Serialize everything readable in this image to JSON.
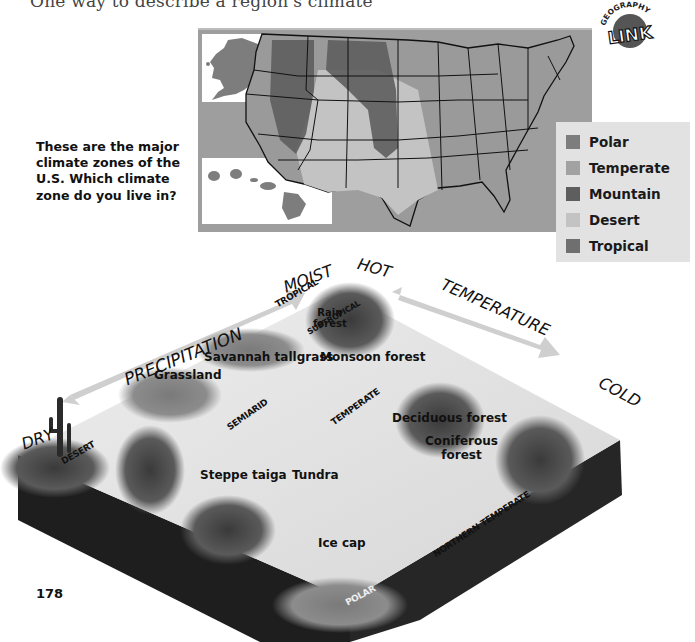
{
  "page": {
    "intro_line": "One way to describe a region's climate",
    "page_number": "178"
  },
  "badge": {
    "top_text": "GEOGRAPHY",
    "main_text": "LINK",
    "icon": "geography-link-badge"
  },
  "question": {
    "text": "These are the major climate zones of the U.S. Which climate zone do you live in?"
  },
  "map": {
    "title": "U.S. climate zones map",
    "colors": {
      "background": "#9e9e9e",
      "state_fill": "#9a9a9a",
      "border": "#111111"
    }
  },
  "legend": {
    "items": [
      {
        "label": "Polar",
        "color": "#7d7d7d"
      },
      {
        "label": "Temperate",
        "color": "#a2a2a2"
      },
      {
        "label": "Mountain",
        "color": "#5e5e5e"
      },
      {
        "label": "Desert",
        "color": "#c3c3c3"
      },
      {
        "label": "Tropical",
        "color": "#6f6f6f"
      }
    ]
  },
  "diagram": {
    "axes": {
      "precipitation": {
        "label": "PRECIPITATION",
        "low": "DRY",
        "high": "MOIST"
      },
      "temperature": {
        "label": "TEMPERATURE",
        "high": "HOT",
        "low": "COLD"
      }
    },
    "zones": [
      "TROPICAL",
      "SUBTROPICAL",
      "DESERT",
      "SEMIARID",
      "TEMPERATE",
      "NORTHERN TEMPERATE",
      "POLAR"
    ],
    "biomes": [
      {
        "label": "Rain forest",
        "line1": "Rain",
        "line2": "forest"
      },
      {
        "label": "Savannah tallgrass"
      },
      {
        "label": "Monsoon forest"
      },
      {
        "label": "Grassland"
      },
      {
        "label": "Deciduous forest"
      },
      {
        "label": "Coniferous forest",
        "line1": "Coniferous",
        "line2": "forest"
      },
      {
        "label": "Steppe taiga"
      },
      {
        "label": "Tundra"
      },
      {
        "label": "Ice cap"
      }
    ]
  }
}
